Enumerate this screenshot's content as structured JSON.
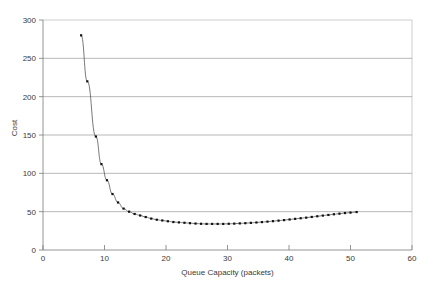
{
  "chart_data": {
    "type": "line",
    "title": "",
    "xlabel": "Queue Capacity (packets)",
    "ylabel": "Cost",
    "xlim": [
      0,
      60
    ],
    "ylim": [
      0,
      300
    ],
    "xticks": [
      0,
      10,
      20,
      30,
      40,
      50,
      60
    ],
    "yticks": [
      0,
      50,
      100,
      150,
      200,
      250,
      300
    ],
    "grid": "horizontal",
    "legend": "none",
    "marker": "square",
    "series": [
      {
        "name": "Cost",
        "x": [
          6.2,
          7.2,
          8.6,
          9.5,
          10.4,
          11.3,
          12.2,
          13.1,
          14.0,
          14.9,
          15.8,
          16.7,
          17.6,
          18.5,
          19.4,
          20.3,
          21.2,
          22.1,
          23.0,
          23.9,
          24.8,
          25.7,
          26.6,
          27.5,
          28.4,
          29.3,
          30.2,
          31.1,
          32.0,
          32.9,
          33.8,
          34.7,
          35.6,
          36.5,
          37.4,
          38.3,
          39.2,
          40.1,
          41.0,
          41.9,
          42.8,
          43.7,
          44.6,
          45.5,
          46.4,
          47.3,
          48.2,
          49.1,
          50.0,
          51.0
        ],
        "y": [
          280,
          220,
          148,
          112,
          91,
          73,
          62,
          54,
          50,
          47,
          45,
          43,
          41,
          39.5,
          38.5,
          37.5,
          36.5,
          36,
          35.5,
          35,
          34.5,
          34.2,
          34,
          34,
          34,
          34,
          34.2,
          34.4,
          34.7,
          35,
          35.4,
          35.9,
          36.4,
          37,
          37.6,
          38.3,
          39,
          39.8,
          40.6,
          41.4,
          42.2,
          43.1,
          44,
          44.9,
          45.7,
          46.6,
          47.4,
          48.2,
          48.8,
          49.5
        ]
      }
    ]
  },
  "axes": {
    "xlabel": "Queue Capacity (packets)",
    "ylabel": "Cost",
    "xtick_labels": [
      "0",
      "10",
      "20",
      "30",
      "40",
      "50",
      "60"
    ],
    "ytick_labels": [
      "0",
      "50",
      "100",
      "150",
      "200",
      "250",
      "300"
    ]
  },
  "colors": {
    "series": "#555555",
    "marker": "#111111",
    "grid": "#9a9a9a",
    "axis": "#7a7a7a",
    "background": "#ffffff"
  }
}
